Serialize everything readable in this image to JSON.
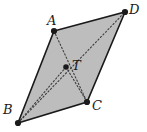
{
  "figure": {
    "type": "geometry-diagram",
    "shape": "parallelogram",
    "background_color": "#ffffff",
    "fill_color": "#bdbdbd",
    "stroke_color": "#1a1a1a",
    "dotted_color": "#3d3d3d",
    "vertices": [
      {
        "label": "A",
        "x": 54,
        "y": 31,
        "label_x": 47,
        "label_y": 14
      },
      {
        "label": "D",
        "x": 125,
        "y": 12,
        "label_x": 129,
        "label_y": 3
      },
      {
        "label": "C",
        "x": 87,
        "y": 102,
        "label_x": 92,
        "label_y": 99
      },
      {
        "label": "B",
        "x": 18,
        "y": 123,
        "label_x": 3,
        "label_y": 103
      }
    ],
    "interior_point": {
      "label": "T",
      "x": 66,
      "y": 67,
      "label_x": 72,
      "label_y": 59
    },
    "outline_path": "M54,31 L125,12 L87,102 L18,123 Z",
    "dotted_segments": [
      {
        "name": "diagonal-a-c",
        "x1": 54,
        "y1": 31,
        "x2": 87,
        "y2": 102
      },
      {
        "name": "diagonal-b-d",
        "x1": 18,
        "y1": 123,
        "x2": 125,
        "y2": 12
      },
      {
        "name": "segment-t-b",
        "x1": 66,
        "y1": 67,
        "x2": 18,
        "y2": 123
      },
      {
        "name": "segment-t-c",
        "x1": 66,
        "y1": 67,
        "x2": 87,
        "y2": 102
      }
    ]
  }
}
